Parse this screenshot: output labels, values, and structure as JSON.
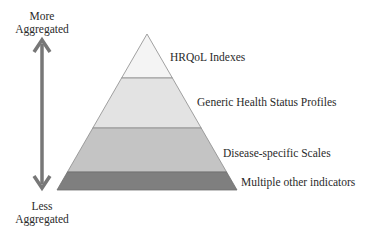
{
  "axis": {
    "top_label": [
      "More",
      "Aggregated"
    ],
    "bottom_label": [
      "Less",
      "Aggregated"
    ],
    "arrow_color": "#777777",
    "arrow_type": "double-headed-vertical"
  },
  "pyramid": {
    "apex": [
      147,
      34
    ],
    "base_left": [
      57,
      190
    ],
    "base_right": [
      237,
      190
    ],
    "tiers": [
      {
        "label": "HRQoL Indexes",
        "top_y": 34,
        "bottom_y": 78,
        "fill": "#f4f4f4"
      },
      {
        "label": "Generic Health Status Profiles",
        "top_y": 78,
        "bottom_y": 128,
        "fill": "#e3e3e3"
      },
      {
        "label": "Disease-specific Scales",
        "top_y": 128,
        "bottom_y": 172,
        "fill": "#c4c4c4"
      },
      {
        "label": "Multiple other indicators",
        "top_y": 172,
        "bottom_y": 190,
        "fill": "#7f7f7f"
      }
    ],
    "outline_color": "#8a8a8a"
  }
}
